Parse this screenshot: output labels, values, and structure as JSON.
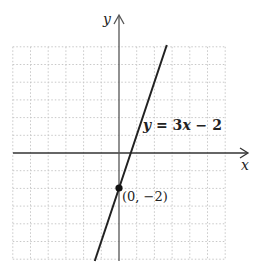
{
  "chart_data": {
    "type": "line",
    "title": "",
    "xlabel": "x",
    "ylabel": "y",
    "xlim": [
      -6,
      6
    ],
    "ylim": [
      -6,
      6
    ],
    "grid": true,
    "series": [
      {
        "name": "y = 3x − 2",
        "slope": 3,
        "intercept": -2,
        "x": [
          -1.37,
          2.7
        ],
        "y": [
          -6.1,
          6.1
        ]
      }
    ],
    "annotations": [
      {
        "text": "(0, −2)",
        "x": 0,
        "y": -2,
        "marker": "dot"
      },
      {
        "text": "y = 3x − 2",
        "position": "beside line, above x-axis"
      }
    ]
  },
  "labels": {
    "x_axis": "x",
    "y_axis": "y",
    "equation_y": "y",
    "equation_eq": " = 3",
    "equation_x": "x",
    "equation_rest": " − 2",
    "point": "(0, −2)"
  },
  "colors": {
    "axis": "#333333",
    "line": "#222222",
    "grid": "#c8c8c8",
    "point": "#111111"
  }
}
